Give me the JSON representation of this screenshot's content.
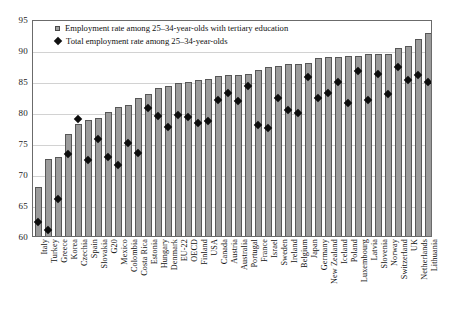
{
  "chart_data": {
    "type": "bar",
    "title": "",
    "subtitle": "",
    "xlabel": "",
    "ylabel": "%",
    "ylim": [
      60,
      95
    ],
    "ytick_step": 5,
    "yticks": [
      60,
      65,
      70,
      75,
      80,
      85,
      90,
      95
    ],
    "grid": true,
    "legend_position": "top-left",
    "categories": [
      "Italy",
      "Turkey",
      "Greece",
      "Korea",
      "Czechia",
      "Spain",
      "Slovakia",
      "G20",
      "Mexico",
      "Colombia",
      "Costa Rica",
      "Estonia",
      "Hungary",
      "Denmark",
      "EU-22",
      "OECD",
      "Finland",
      "USA",
      "Canada",
      "Austria",
      "Australia",
      "Portugal",
      "France",
      "Israel",
      "Sweden",
      "Ireland",
      "Belgium",
      "Japan",
      "Germany",
      "New Zealand",
      "Iceland",
      "Poland",
      "Luxembourg",
      "Latvia",
      "Slovenia",
      "Norway",
      "Switzerland",
      "UK",
      "Netherlands",
      "Lithuania"
    ],
    "series": [
      {
        "name": "Employment rate among 25–34-year-olds with tertiary education",
        "marker": "bar",
        "color": "#9b9b9b",
        "values": [
          67.9,
          72.4,
          72.7,
          76.4,
          78.0,
          78.7,
          79.1,
          80.0,
          80.8,
          81.1,
          82.2,
          82.9,
          83.8,
          84.2,
          84.6,
          84.8,
          85.1,
          85.3,
          85.8,
          85.9,
          86.0,
          86.2,
          86.8,
          87.2,
          87.5,
          87.7,
          87.7,
          87.9,
          88.7,
          88.9,
          88.9,
          89.1,
          89.1,
          89.3,
          89.3,
          89.4,
          90.3,
          90.6,
          91.8,
          92.7
        ]
      },
      {
        "name": "Total employment rate among 25–34-year-olds",
        "marker": "diamond",
        "color": "#0d0d0d",
        "values": [
          62.3,
          61.0,
          65.9,
          73.2,
          78.8,
          72.3,
          75.7,
          72.8,
          71.5,
          75.0,
          73.4,
          80.6,
          79.4,
          77.6,
          79.5,
          79.2,
          78.2,
          78.6,
          81.9,
          83.1,
          81.7,
          84.2,
          77.9,
          77.4,
          82.2,
          80.4,
          79.9,
          85.6,
          82.3,
          83.0,
          84.8,
          81.5,
          86.6,
          82.0,
          86.2,
          82.9,
          87.3,
          85.1,
          85.9,
          84.8
        ]
      }
    ]
  },
  "legend": {
    "items": [
      {
        "icon": "gray-square-marker",
        "label": "Employment rate among 25–34-year-olds with tertiary education"
      },
      {
        "icon": "black-diamond-marker",
        "label": "Total employment rate among 25–34-year-olds"
      }
    ]
  },
  "axis": {
    "unit_label": "%"
  }
}
